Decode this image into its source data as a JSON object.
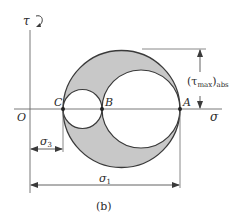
{
  "figure": {
    "caption": "(b)",
    "axes": {
      "tau_label": "τ",
      "sigma_label": "σ",
      "origin_label": "O"
    },
    "points": {
      "C": "C",
      "B": "B",
      "A": "A"
    },
    "dimensions": {
      "tau_max_label": "(τ",
      "tau_max_sub": "max",
      "tau_max_close": ")",
      "tau_max_abs": "abs",
      "sigma3_label": "σ",
      "sigma3_sub": "3",
      "sigma1_label": "σ",
      "sigma1_sub": "1"
    },
    "colors": {
      "line": "#3a3a3a",
      "fill": "#c8c8c8",
      "background": "#ffffff"
    }
  }
}
